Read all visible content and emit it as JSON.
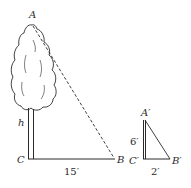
{
  "figure": {
    "large_triangle": {
      "vertex_top": "A",
      "vertex_base_left": "C",
      "vertex_base_right": "B",
      "height_label": "h",
      "base_label": "15′",
      "hypotenuse_style": "dashed"
    },
    "small_triangle": {
      "vertex_top": "A′",
      "vertex_base_left": "C′",
      "vertex_base_right": "B′",
      "height_label": "6′",
      "base_label": "2′",
      "hypotenuse_style": "solid"
    },
    "colors": {
      "stroke": "#2a2a2a",
      "background": "#ffffff"
    }
  }
}
